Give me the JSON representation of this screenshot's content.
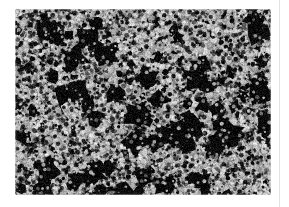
{
  "page": {
    "background_color": "#ffffff",
    "width": 289,
    "height": 207
  },
  "figure": {
    "name": "micrograph",
    "kind": "electron-micrograph",
    "caption": "",
    "alt_text": "Grayscale electron micrograph of densely packed granular particles",
    "frame": {
      "x": 15,
      "y": 9,
      "width": 256,
      "height": 186,
      "corner_radius": 3
    },
    "appearance": {
      "particle_color": "#b9b9b9",
      "particle_highlight_color": "#e2e2e2",
      "particle_shadow_color": "#6e6e6e",
      "void_color": "#0b0b0b",
      "background_color": "#0c0c0c",
      "mean_particle_radius_px": 4.2,
      "particle_count": 3400,
      "void_blob_count": 150,
      "noise_amount": 0.16
    }
  },
  "column_rule": {
    "name": "column-rule",
    "color": "#e3e3e3",
    "x": 279,
    "width": 1
  }
}
